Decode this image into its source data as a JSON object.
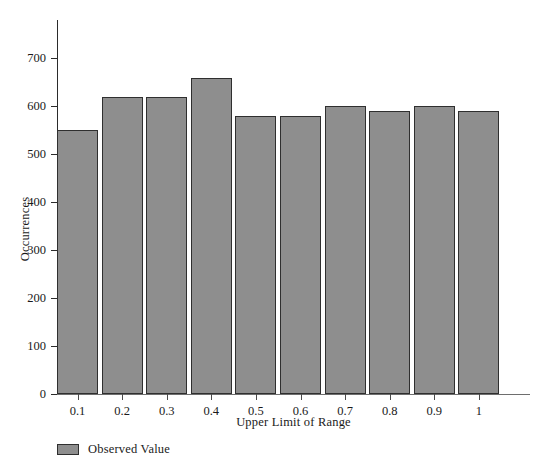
{
  "chart_data": {
    "type": "bar",
    "title": "",
    "subtitle": "",
    "xlabel": "Upper Limit of Range",
    "ylabel": "Occurrences",
    "categories": [
      "0.1",
      "0.2",
      "0.3",
      "0.4",
      "0.5",
      "0.6",
      "0.7",
      "0.8",
      "0.9",
      "1"
    ],
    "values": [
      550,
      620,
      620,
      660,
      580,
      580,
      600,
      590,
      600,
      590
    ],
    "series": [
      {
        "name": "Observed Value",
        "values": [
          550,
          620,
          620,
          660,
          580,
          580,
          600,
          590,
          600,
          590
        ]
      }
    ],
    "ylim": [
      0,
      780
    ],
    "y_ticks": [
      0,
      100,
      200,
      300,
      400,
      500,
      600,
      700
    ],
    "y_tick_labels": [
      "0",
      "100",
      "200",
      "300",
      "400",
      "500",
      "600",
      "700"
    ],
    "x_tick_labels": [
      "0.1",
      "0.2",
      "0.3",
      "0.4",
      "0.5",
      "0.6",
      "0.7",
      "0.8",
      "0.9",
      "1"
    ],
    "grid": false,
    "legend_position": "below-left",
    "bar_color": "#8e8e8e",
    "bar_border_color": "#2f2f2f",
    "axis_color": "#2b2b2b",
    "text_color": "#1a1a1a",
    "background": "#ffffff"
  },
  "legend": {
    "entries": [
      {
        "label": "Observed Value",
        "color": "#8e8e8e"
      }
    ]
  }
}
